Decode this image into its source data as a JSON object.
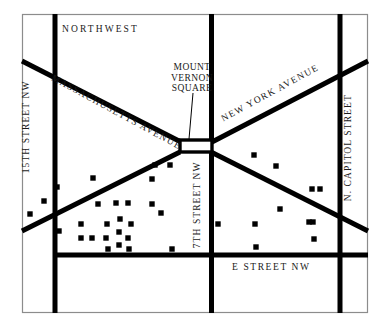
{
  "figure": {
    "name": "mount-vernon-square-area-map",
    "type": "street-map",
    "width": 391,
    "height": 327,
    "background_color": "#ffffff",
    "ink_color": "#000000",
    "border_color": "#8c8c8c",
    "marker_color": "#000000"
  },
  "area_label": {
    "text": "NORTHWEST"
  },
  "landmark": {
    "name_line_1": "MOUNT",
    "name_line_2": "VERNON",
    "name_line_3": "SQUARE",
    "full_text": "MOUNT VERNON SQUARE"
  },
  "streets": [
    {
      "id": "massachusetts-avenue",
      "label": "MASSACHUSETTS AVENUE",
      "orientation": "diagonal-nw-se"
    },
    {
      "id": "new-york-avenue",
      "label": "NEW YORK AVENUE",
      "orientation": "diagonal-ne-sw"
    },
    {
      "id": "15th-street-nw",
      "label": "15TH STREET NW",
      "orientation": "vertical"
    },
    {
      "id": "7th-street-nw",
      "label": "7TH STREET NW",
      "orientation": "vertical"
    },
    {
      "id": "n-capitol-street",
      "label": "N. CAPITOL STREET",
      "orientation": "vertical"
    },
    {
      "id": "e-street-nw",
      "label": "E STREET NW",
      "orientation": "horizontal"
    }
  ],
  "street_labels": {
    "massachusetts_avenue": "MASSACHUSETTS AVENUE",
    "new_york_avenue": "NEW YORK AVENUE",
    "fifteenth_street_nw": "15TH STREET NW",
    "seventh_street_nw": "7TH STREET NW",
    "n_capitol_street": "N. CAPITOL STREET",
    "e_street_nw": "E STREET NW"
  },
  "map_geometry": {
    "frame": {
      "x": 22,
      "y": 14,
      "width": 346,
      "height": 299
    },
    "road_width": 5.0,
    "square": {
      "x": 180,
      "y": 140,
      "width": 32,
      "height": 11
    },
    "vertical_roads": [
      {
        "id": "15th-street-nw",
        "x": 55,
        "y1": 14,
        "y2": 313
      },
      {
        "id": "7th-street-nw",
        "x": 211,
        "y1": 14,
        "y2": 313
      },
      {
        "id": "n-capitol-street",
        "x": 340,
        "y1": 14,
        "y2": 313
      }
    ],
    "horizontal_roads": [
      {
        "id": "e-street-nw",
        "y": 255,
        "x1": 55,
        "x2": 368
      }
    ],
    "diagonal_roads": [
      {
        "id": "massachusetts-avenue-nw",
        "x1": 22,
        "y1": 62,
        "x2": 180,
        "y2": 143
      },
      {
        "id": "massachusetts-avenue-se",
        "x1": 212,
        "y1": 151,
        "x2": 368,
        "y2": 230
      },
      {
        "id": "new-york-avenue-ne",
        "x1": 368,
        "y1": 62,
        "x2": 212,
        "y2": 143
      },
      {
        "id": "new-york-avenue-sw",
        "x1": 180,
        "y1": 151,
        "x2": 22,
        "y2": 230
      }
    ]
  },
  "markers": {
    "shape": "square",
    "size": 5.4,
    "count": 37,
    "points": [
      {
        "x": 30,
        "y": 214
      },
      {
        "x": 44,
        "y": 201
      },
      {
        "x": 57,
        "y": 187
      },
      {
        "x": 59,
        "y": 231
      },
      {
        "x": 81,
        "y": 224
      },
      {
        "x": 81,
        "y": 238
      },
      {
        "x": 92,
        "y": 238
      },
      {
        "x": 93,
        "y": 178
      },
      {
        "x": 106,
        "y": 238
      },
      {
        "x": 107,
        "y": 224
      },
      {
        "x": 108,
        "y": 249
      },
      {
        "x": 116,
        "y": 203
      },
      {
        "x": 119,
        "y": 232
      },
      {
        "x": 119,
        "y": 245
      },
      {
        "x": 120,
        "y": 219
      },
      {
        "x": 128,
        "y": 203
      },
      {
        "x": 128,
        "y": 238
      },
      {
        "x": 129,
        "y": 249
      },
      {
        "x": 131,
        "y": 224
      },
      {
        "x": 152,
        "y": 179
      },
      {
        "x": 152,
        "y": 204
      },
      {
        "x": 161,
        "y": 213
      },
      {
        "x": 170,
        "y": 165
      },
      {
        "x": 172,
        "y": 249
      },
      {
        "x": 218,
        "y": 224
      },
      {
        "x": 254,
        "y": 155
      },
      {
        "x": 255,
        "y": 224
      },
      {
        "x": 256,
        "y": 247
      },
      {
        "x": 276,
        "y": 166
      },
      {
        "x": 280,
        "y": 209
      },
      {
        "x": 309,
        "y": 222
      },
      {
        "x": 312,
        "y": 189
      },
      {
        "x": 313,
        "y": 222
      },
      {
        "x": 314,
        "y": 239
      },
      {
        "x": 320,
        "y": 189
      },
      {
        "x": 155,
        "y": 165
      },
      {
        "x": 98,
        "y": 204
      }
    ]
  },
  "leader_line": {
    "id": "mount-vernon-square-leader",
    "x1": 193,
    "y1": 92,
    "x2": 189,
    "y2": 140
  }
}
